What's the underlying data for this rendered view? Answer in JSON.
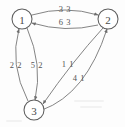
{
  "diagram": {
    "background_color": "#fdfdfd",
    "stroke_color": "#6e6e6e",
    "node_fill": "#ffffff",
    "label_color": "#555555"
  },
  "nodes": [
    {
      "id": "1",
      "label": "1",
      "cx": 22,
      "cy": 19,
      "r": 10
    },
    {
      "id": "2",
      "label": "2",
      "cx": 108,
      "cy": 19,
      "r": 10
    },
    {
      "id": "3",
      "label": "3",
      "cx": 34,
      "cy": 110,
      "r": 10
    }
  ],
  "edges": [
    {
      "id": "e1",
      "from": "1",
      "to": "2",
      "label": "3 3",
      "label_x": 65,
      "label_y": 9,
      "direction": "1-to-2",
      "position": "top-upper"
    },
    {
      "id": "e2",
      "from": "2",
      "to": "1",
      "label": "6 3",
      "label_x": 65,
      "label_y": 22,
      "direction": "2-to-1",
      "position": "top-lower"
    },
    {
      "id": "e3",
      "from": "3",
      "to": "1",
      "label": "2 2",
      "label_x": 16,
      "label_y": 65,
      "direction": "3-to-1",
      "position": "left-outer"
    },
    {
      "id": "e4",
      "from": "1",
      "to": "3",
      "label": "5 2",
      "label_x": 37,
      "label_y": 65,
      "direction": "1-to-3",
      "position": "left-inner"
    },
    {
      "id": "e5",
      "from": "2",
      "to": "3",
      "label": "1 1",
      "label_x": 68,
      "label_y": 64,
      "direction": "2-to-3",
      "position": "right-inner"
    },
    {
      "id": "e6",
      "from": "3",
      "to": "2",
      "label": "4 1",
      "label_x": 79,
      "label_y": 78,
      "direction": "3-to-2",
      "position": "right-outer"
    }
  ]
}
